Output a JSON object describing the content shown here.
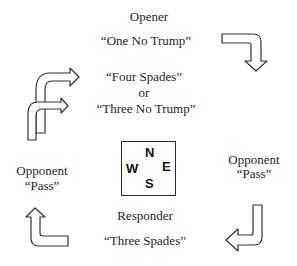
{
  "opener": {
    "role": "Opener",
    "bid": "“One No Trump”"
  },
  "options": {
    "first": "“Four Spades”",
    "connector": "or",
    "second": "“Three No Trump”"
  },
  "left_opponent": {
    "role": "Opponent",
    "bid": "“Pass”"
  },
  "right_opponent": {
    "role": "Opponent",
    "bid": "“Pass”"
  },
  "responder": {
    "role": "Responder",
    "bid": "“Three Spades”"
  },
  "compass": {
    "north": "N",
    "south": "S",
    "east": "E",
    "west": "W"
  },
  "colors": {
    "stroke": "#333333",
    "text": "#1e1e1e",
    "background": "#ffffff"
  }
}
